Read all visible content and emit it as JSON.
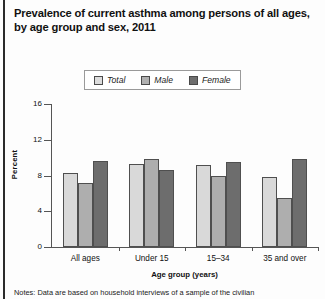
{
  "title": {
    "line1": "Prevalence of current asthma among persons of all ages,",
    "line2": "by age group and sex, 2011"
  },
  "legend": {
    "items": [
      {
        "label": "Total",
        "color": "#d9d9d9"
      },
      {
        "label": "Male",
        "color": "#aeaeae"
      },
      {
        "label": "Female",
        "color": "#6d6d6d"
      }
    ]
  },
  "notes": "Notes: Data are based on household interviews of a sample of the civilian",
  "chart_data": {
    "type": "bar",
    "title": "Prevalence of current asthma among persons of all ages, by age group and sex, 2011",
    "xlabel": "Age group (years)",
    "ylabel": "Percent",
    "categories": [
      "All ages",
      "Under 15",
      "15–34",
      "35 and over"
    ],
    "series": [
      {
        "name": "Total",
        "values": [
          8.3,
          9.3,
          9.2,
          7.8
        ]
      },
      {
        "name": "Male",
        "values": [
          7.2,
          9.9,
          7.9,
          5.5
        ]
      },
      {
        "name": "Female",
        "values": [
          9.6,
          8.6,
          9.5,
          9.9
        ]
      }
    ],
    "ylim": [
      0,
      16
    ],
    "yticks": [
      0,
      4,
      8,
      12,
      16
    ],
    "grid": false,
    "legend_position": "top-center"
  }
}
